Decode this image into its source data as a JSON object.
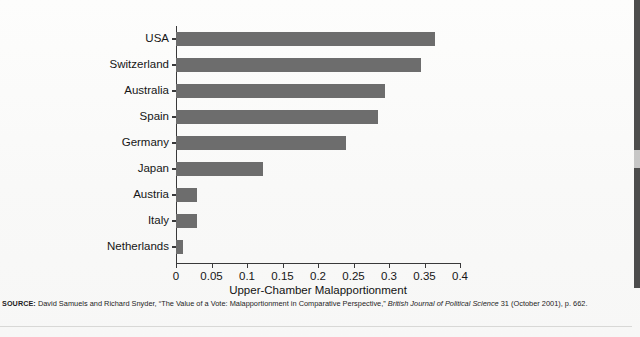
{
  "chart_data": {
    "type": "bar",
    "orientation": "horizontal",
    "title": "",
    "xlabel": "Upper-Chamber Malapportionment",
    "ylabel": "",
    "categories": [
      "USA",
      "Switzerland",
      "Australia",
      "Spain",
      "Germany",
      "Japan",
      "Austria",
      "Italy",
      "Netherlands"
    ],
    "values": [
      0.365,
      0.345,
      0.295,
      0.285,
      0.24,
      0.122,
      0.03,
      0.03,
      0.01
    ],
    "xlim": [
      0,
      0.4
    ],
    "xticks": [
      "0",
      "0.05",
      "0.1",
      "0.15",
      "0.2",
      "0.25",
      "0.3",
      "0.35",
      "0.4"
    ],
    "xtick_values": [
      0,
      0.05,
      0.1,
      0.15,
      0.2,
      0.25,
      0.3,
      0.35,
      0.4
    ],
    "grid": false,
    "legend": "none",
    "bar_color": "#6d6d6d",
    "axis_color": "#39393a"
  },
  "source": {
    "label": "SOURCE:",
    "text_before": " David Samuels and Richard Snyder, “The Value of a Vote: Malapportionment in Comparative Perspective,” ",
    "journal": "British Journal of Political Science",
    "text_after": " 31 (October 2001), p. 662."
  },
  "ghost": {
    "line1": "",
    "line2": ""
  }
}
